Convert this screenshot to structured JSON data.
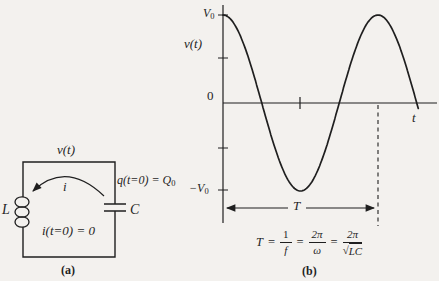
{
  "palette": {
    "paper": "#f3f1ee",
    "ink": "#1f1f1f"
  },
  "circuit": {
    "voltage_label": "v(t)",
    "inductor_label": "L",
    "capacitor_label": "C",
    "current_label": "i",
    "initial_charge": {
      "prefix": "q(t=0) = Q",
      "sub": "0"
    },
    "initial_current": "i(t=0) = 0",
    "caption": "(a)"
  },
  "graph": {
    "vmax_label": {
      "base": "V",
      "sub": "0"
    },
    "curve_label": "v(t)",
    "zero_label": "0",
    "vmin_label": {
      "base": "−V",
      "sub": "0"
    },
    "time_axis_label": "t",
    "period_label": "T",
    "caption": "(b)"
  },
  "formula": {
    "lhs": "T",
    "eq": "=",
    "frac1": {
      "num": "1",
      "den": "f"
    },
    "frac2": {
      "num": "2π",
      "den": "ω"
    },
    "frac3": {
      "num": "2π",
      "radical": "√",
      "radicand": "LC"
    }
  },
  "chart_data": {
    "type": "line",
    "title": "",
    "xlabel": "t",
    "ylabel": "v(t)",
    "function": "v(t) = V0 · cos(2π t / T)",
    "amplitude": "V0",
    "y_ticks": [
      "V0",
      "V0/2",
      "0",
      "−V0/2",
      "−V0"
    ],
    "x_ticks": [
      "T/2 (unlabeled tick)",
      "T (dashed vertical marker)"
    ],
    "t_range_periods": [
      0,
      1.26
    ],
    "period_annotation": "T = 1/f = 2π/ω = 2π/√LC",
    "legend": "none",
    "grid": "off"
  }
}
